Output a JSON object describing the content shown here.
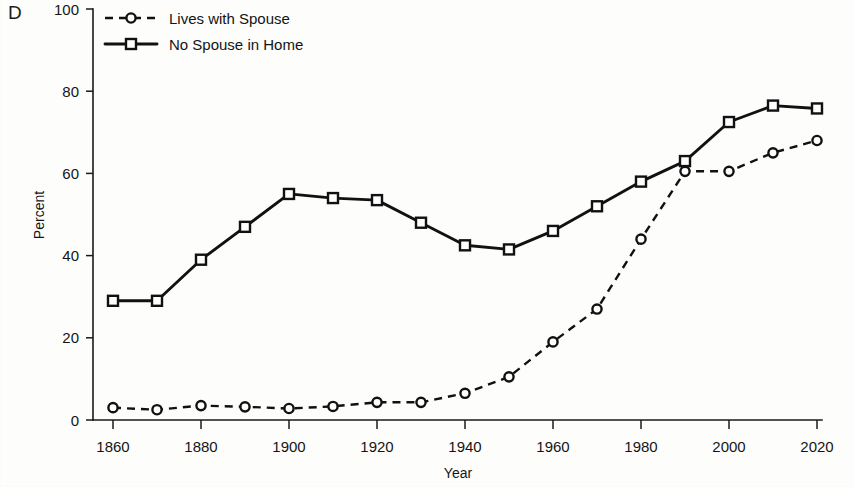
{
  "panel": {
    "label": "D"
  },
  "chart_data": {
    "type": "line",
    "title": "",
    "xlabel": "Year",
    "ylabel": "Percent",
    "xlim": [
      1860,
      2020
    ],
    "ylim": [
      0,
      100
    ],
    "grid": false,
    "legend_position": "top-left",
    "x": [
      1860,
      1870,
      1880,
      1890,
      1900,
      1910,
      1920,
      1930,
      1940,
      1950,
      1960,
      1970,
      1980,
      1990,
      2000,
      2010,
      2020
    ],
    "xticks": [
      1860,
      1880,
      1900,
      1920,
      1940,
      1960,
      1980,
      2000,
      2020
    ],
    "xtick_labels": [
      "1860",
      "1880",
      "1900",
      "1920",
      "1940",
      "1960",
      "1980",
      "2000",
      "2020"
    ],
    "yticks": [
      0,
      20,
      40,
      60,
      80,
      100
    ],
    "ytick_labels": [
      "0",
      "20",
      "40",
      "60",
      "80",
      "100"
    ],
    "series": [
      {
        "name": "Lives with Spouse",
        "marker": "circle",
        "line_style": "dashed",
        "color": "#111111",
        "values": [
          3.0,
          2.5,
          3.5,
          3.2,
          2.8,
          3.3,
          4.3,
          4.3,
          6.5,
          10.5,
          19.0,
          27.0,
          44.0,
          60.5,
          60.5,
          65.0,
          68.0
        ]
      },
      {
        "name": "No Spouse in Home",
        "marker": "square",
        "line_style": "solid",
        "color": "#111111",
        "values": [
          29.0,
          29.0,
          39.0,
          47.0,
          55.0,
          54.0,
          53.5,
          48.0,
          42.5,
          41.5,
          46.0,
          52.0,
          58.0,
          63.0,
          72.5,
          76.5,
          75.8
        ]
      }
    ]
  },
  "legend": {
    "items": [
      {
        "label": "Lives with Spouse",
        "marker": "circle",
        "line_style": "dashed"
      },
      {
        "label": "No Spouse in Home",
        "marker": "square",
        "line_style": "solid"
      }
    ]
  }
}
